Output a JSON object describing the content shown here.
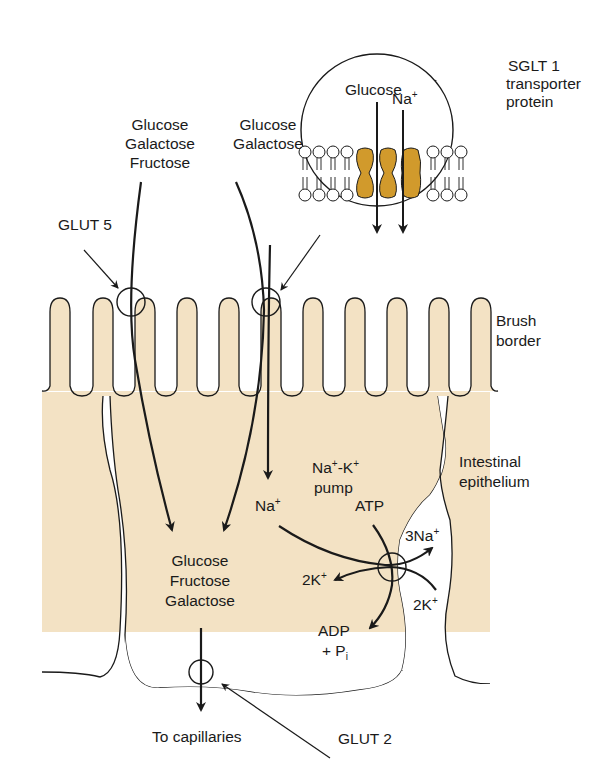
{
  "diagram": {
    "type": "intestinal monosaccharide absorption",
    "colors": {
      "cell_fill": "#f3e2c4",
      "protein_fill": "#d19a2c",
      "stroke": "#1a1a1a",
      "background": "#ffffff"
    },
    "labels": {
      "apical_left": [
        "Glucose",
        "Galactose",
        "Fructose"
      ],
      "apical_mid": [
        "Glucose",
        "Galactose"
      ],
      "glut5": "GLUT 5",
      "inset_glucose": "Glucose",
      "inset_na": "Na",
      "sglt1": [
        "SGLT 1",
        "transporter",
        "protein"
      ],
      "brush_border": [
        "Brush",
        "border"
      ],
      "pump": [
        "Na",
        "-K",
        "pump"
      ],
      "intestinal_epithelium": [
        "Intestinal",
        "epithelium"
      ],
      "na_cell": "Na",
      "atp": "ATP",
      "three_na": "3Na",
      "two_k_in": "2K",
      "two_k_out": "2K",
      "adp": "ADP",
      "pi": "+ P",
      "pi_sub": "i",
      "cell_sugars": [
        "Glucose",
        "Fructose",
        "Galactose"
      ],
      "to_capillaries": "To capillaries",
      "glut2": "GLUT 2",
      "plus": "+"
    }
  }
}
